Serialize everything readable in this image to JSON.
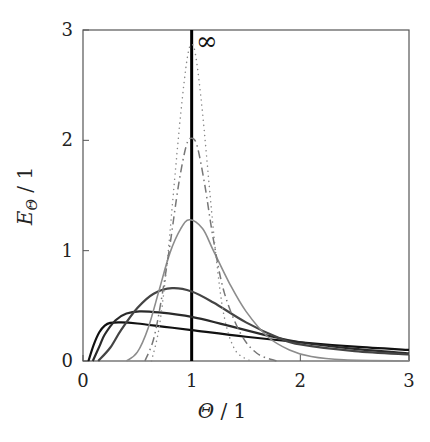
{
  "chart_data": {
    "type": "line",
    "title": "",
    "xlabel": "Θ / 1",
    "ylabel": "E_Θ / 1",
    "xlim": [
      0,
      3
    ],
    "ylim": [
      0,
      3
    ],
    "xticks": [
      "0",
      "1",
      "2",
      "3"
    ],
    "yticks": [
      "0",
      "1",
      "2",
      "3"
    ],
    "grid": false,
    "legend": "none",
    "annotations": [
      {
        "text": "∞",
        "x": 1.1,
        "y": 2.9,
        "note": "ideal plug flow (Dirac delta at Θ = 1)"
      }
    ],
    "series": [
      {
        "name": "plug-flow-delta",
        "style": "solid",
        "color": "#000000",
        "width": 3,
        "x": [
          1,
          1
        ],
        "y": [
          0,
          3
        ]
      },
      {
        "name": "curve-black",
        "style": "solid",
        "color": "#111111",
        "width": 2.2,
        "x": [
          0.05,
          0.1,
          0.15,
          0.2,
          0.25,
          0.35,
          0.5,
          0.75,
          1.0,
          1.5,
          2.0,
          2.5,
          3.0
        ],
        "y": [
          0,
          0.15,
          0.26,
          0.32,
          0.345,
          0.35,
          0.34,
          0.31,
          0.28,
          0.22,
          0.17,
          0.13,
          0.1
        ]
      },
      {
        "name": "curve-darkgray-1",
        "style": "solid",
        "color": "#2a2a2a",
        "width": 2.2,
        "x": [
          0.09,
          0.15,
          0.2,
          0.3,
          0.4,
          0.52,
          0.7,
          1.0,
          1.3,
          1.7,
          2.0,
          2.5,
          3.0
        ],
        "y": [
          0,
          0.13,
          0.24,
          0.37,
          0.43,
          0.45,
          0.44,
          0.4,
          0.33,
          0.23,
          0.17,
          0.11,
          0.07
        ]
      },
      {
        "name": "curve-darkgray-2",
        "style": "solid",
        "color": "#444444",
        "width": 2.2,
        "x": [
          0.14,
          0.25,
          0.35,
          0.5,
          0.65,
          0.82,
          1.0,
          1.2,
          1.5,
          1.8,
          2.0,
          2.5,
          3.0
        ],
        "y": [
          0,
          0.12,
          0.28,
          0.48,
          0.61,
          0.66,
          0.63,
          0.53,
          0.35,
          0.21,
          0.15,
          0.09,
          0.06
        ]
      },
      {
        "name": "curve-gray",
        "style": "solid",
        "color": "#8c8c8c",
        "width": 1.6,
        "x": [
          0.4,
          0.5,
          0.6,
          0.7,
          0.8,
          0.9,
          0.98,
          1.1,
          1.2,
          1.35,
          1.5,
          1.7,
          1.9,
          2.1,
          2.4,
          3.0
        ],
        "y": [
          0,
          0.08,
          0.3,
          0.64,
          0.98,
          1.2,
          1.28,
          1.2,
          1.0,
          0.7,
          0.45,
          0.22,
          0.1,
          0.04,
          0.01,
          0
        ]
      },
      {
        "name": "curve-dashdot",
        "style": "dashdot",
        "color": "#777777",
        "width": 1.5,
        "x": [
          0.57,
          0.65,
          0.72,
          0.8,
          0.88,
          0.95,
          1.0,
          1.05,
          1.12,
          1.2,
          1.3,
          1.45,
          1.6,
          1.78
        ],
        "y": [
          0,
          0.2,
          0.55,
          1.05,
          1.6,
          1.95,
          2.02,
          1.95,
          1.6,
          1.1,
          0.62,
          0.25,
          0.07,
          0
        ]
      },
      {
        "name": "curve-dotted",
        "style": "dotted",
        "color": "#888888",
        "width": 1.5,
        "x": [
          0.63,
          0.7,
          0.77,
          0.83,
          0.9,
          0.96,
          1.0,
          1.04,
          1.1,
          1.17,
          1.23,
          1.3,
          1.4,
          1.54
        ],
        "y": [
          0,
          0.3,
          0.85,
          1.5,
          2.25,
          2.75,
          2.87,
          2.75,
          2.25,
          1.5,
          0.9,
          0.4,
          0.1,
          0
        ]
      }
    ]
  },
  "axes": {
    "xlabel_main": "Θ",
    "xlabel_unit": " / 1",
    "ylabel_main": "E",
    "ylabel_sub": "Θ",
    "ylabel_unit": " / 1",
    "infinity_label": "∞"
  }
}
